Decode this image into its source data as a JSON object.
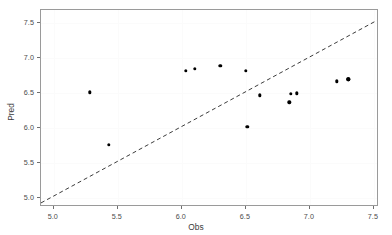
{
  "chart_data": {
    "type": "scatter",
    "title": "",
    "xlabel": "Obs",
    "ylabel": "Pred",
    "xlim": [
      4.9,
      7.54
    ],
    "ylim": [
      4.87,
      7.69
    ],
    "xticks": [
      5.0,
      5.5,
      6.0,
      6.5,
      7.0,
      7.5
    ],
    "yticks": [
      5.0,
      5.5,
      6.0,
      6.5,
      7.0,
      7.5
    ],
    "xtick_labels": [
      "5.0",
      "5.5",
      "6.0",
      "6.5",
      "7.0",
      "7.5"
    ],
    "ytick_labels": [
      "5.0",
      "5.5",
      "6.0",
      "6.5",
      "7.0",
      "7.5"
    ],
    "grid": true,
    "legend": "none",
    "point_color": "#000000",
    "reference_line": {
      "style": "dashed",
      "color": "#3a3a3a",
      "slope": 1,
      "intercept": 0,
      "from": [
        4.9,
        4.9
      ],
      "to": [
        7.54,
        7.54
      ]
    },
    "points": [
      {
        "x": 5.28,
        "y": 6.51
      },
      {
        "x": 5.43,
        "y": 5.76
      },
      {
        "x": 6.03,
        "y": 6.82
      },
      {
        "x": 6.1,
        "y": 6.85
      },
      {
        "x": 6.3,
        "y": 6.89
      },
      {
        "x": 6.5,
        "y": 6.82
      },
      {
        "x": 6.51,
        "y": 6.02
      },
      {
        "x": 6.61,
        "y": 6.47
      },
      {
        "x": 6.84,
        "y": 6.37
      },
      {
        "x": 6.85,
        "y": 6.49
      },
      {
        "x": 6.9,
        "y": 6.5
      },
      {
        "x": 7.21,
        "y": 6.67
      },
      {
        "x": 7.3,
        "y": 6.7
      },
      {
        "x": 7.3,
        "y": 6.7
      }
    ]
  }
}
